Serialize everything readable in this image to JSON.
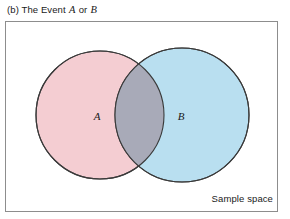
{
  "figure": {
    "caption_prefix": "(b) The Event",
    "caption_var_a": "A",
    "caption_connector": "or",
    "caption_var_b": "B",
    "sample_space_label": "Sample space"
  },
  "diagram": {
    "type": "venn",
    "set_a_label": "A",
    "set_b_label": "B",
    "highlight": "union",
    "colors": {
      "set_a_fill": "#f4cdd2",
      "set_b_fill": "#b9dff0",
      "intersection_fill": "#a8aab8",
      "circle_stroke": "#3a3a3a",
      "box_border": "#8d8d8d",
      "box_fill": "#ffffff",
      "text": "#1a1a1a",
      "page_background": "#ffffff"
    },
    "geometry": {
      "box_x": 5,
      "box_y": 21,
      "box_width": 273,
      "box_height": 191,
      "circle_a_cx": 100,
      "circle_a_cy": 115,
      "circle_a_r": 64,
      "circle_b_cx": 182,
      "circle_b_cy": 115,
      "circle_b_r": 67
    }
  }
}
